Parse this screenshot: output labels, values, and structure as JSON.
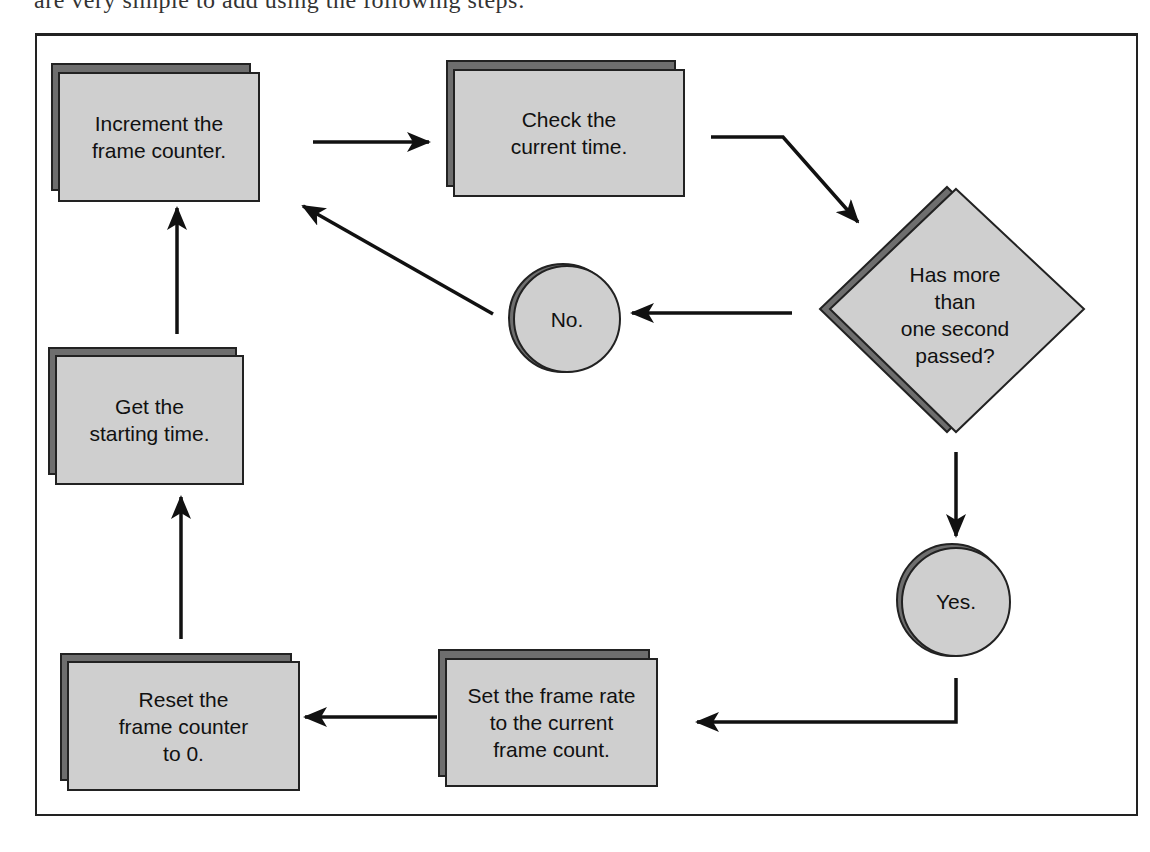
{
  "page": {
    "top_text_fragment": "are very simple to add using the following steps:"
  },
  "flowchart": {
    "title": "Frame rate calculation flowchart",
    "nodes": {
      "increment": {
        "shape": "process",
        "text": "Increment the\nframe counter."
      },
      "check_time": {
        "shape": "process",
        "text": "Check the\ncurrent time."
      },
      "decision": {
        "shape": "decision",
        "text": "Has more\nthan\none second\npassed?"
      },
      "no": {
        "shape": "connector",
        "text": "No."
      },
      "yes": {
        "shape": "connector",
        "text": "Yes."
      },
      "get_start": {
        "shape": "process",
        "text": "Get the\nstarting time."
      },
      "set_rate": {
        "shape": "process",
        "text": "Set the frame rate\nto the current\nframe count."
      },
      "reset": {
        "shape": "process",
        "text": "Reset the\nframe counter\nto 0."
      }
    },
    "edges": [
      {
        "from": "increment",
        "to": "check_time"
      },
      {
        "from": "check_time",
        "to": "decision"
      },
      {
        "from": "decision",
        "to": "no"
      },
      {
        "from": "no",
        "to": "increment"
      },
      {
        "from": "decision",
        "to": "yes"
      },
      {
        "from": "yes",
        "to": "set_rate"
      },
      {
        "from": "set_rate",
        "to": "reset"
      },
      {
        "from": "reset",
        "to": "get_start"
      },
      {
        "from": "get_start",
        "to": "increment"
      }
    ],
    "colors": {
      "fill": "#cfcfcf",
      "shadow": "#6e6e6e",
      "stroke": "#222222",
      "text": "#111111"
    }
  }
}
